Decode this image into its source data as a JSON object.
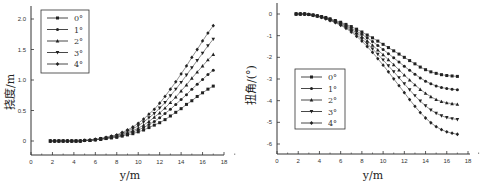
{
  "chart_data": [
    {
      "type": "line",
      "title": "",
      "xlabel": "y/m",
      "ylabel": "挠度/m",
      "xlim": [
        0,
        19
      ],
      "ylim": [
        -0.25,
        2.2
      ],
      "x_ticks": [
        "0",
        "2",
        "4",
        "6",
        "8",
        "10",
        "12",
        "14",
        "16",
        "18"
      ],
      "y_ticks": [
        "0",
        "0.5",
        "1.0",
        "1.5",
        "2.0"
      ],
      "legend_position": "upper left",
      "grid": false,
      "x": [
        1.8,
        2.2,
        2.6,
        3.0,
        3.4,
        3.8,
        4.2,
        4.6,
        5.0,
        5.5,
        6.0,
        6.5,
        7.0,
        7.5,
        8.0,
        8.5,
        9.0,
        9.5,
        10.0,
        10.5,
        11.0,
        11.5,
        12.0,
        12.5,
        13.0,
        13.5,
        14.0,
        14.5,
        15.0,
        15.5,
        16.0,
        16.5,
        17.0
      ],
      "series": [
        {
          "name": "0°",
          "marker": "square",
          "values": [
            0,
            0,
            0,
            0,
            0,
            0,
            0,
            0,
            0.01,
            0.01,
            0.02,
            0.03,
            0.04,
            0.05,
            0.06,
            0.08,
            0.1,
            0.12,
            0.15,
            0.18,
            0.22,
            0.26,
            0.3,
            0.35,
            0.41,
            0.47,
            0.53,
            0.6,
            0.66,
            0.73,
            0.79,
            0.85,
            0.9
          ]
        },
        {
          "name": "1°",
          "marker": "circle",
          "values": [
            0,
            0,
            0,
            0,
            0,
            0,
            0,
            0,
            0.01,
            0.01,
            0.02,
            0.03,
            0.04,
            0.06,
            0.07,
            0.09,
            0.12,
            0.15,
            0.18,
            0.22,
            0.27,
            0.32,
            0.38,
            0.45,
            0.52,
            0.6,
            0.68,
            0.76,
            0.85,
            0.93,
            1.01,
            1.09,
            1.16
          ]
        },
        {
          "name": "2°",
          "marker": "triangle-up",
          "values": [
            0,
            0,
            0,
            0,
            0,
            0,
            0,
            0,
            0.01,
            0.01,
            0.02,
            0.03,
            0.05,
            0.06,
            0.08,
            0.11,
            0.14,
            0.17,
            0.21,
            0.26,
            0.32,
            0.39,
            0.46,
            0.54,
            0.63,
            0.72,
            0.82,
            0.92,
            1.03,
            1.13,
            1.23,
            1.33,
            1.42
          ]
        },
        {
          "name": "3°",
          "marker": "triangle-down",
          "values": [
            0,
            0,
            0,
            0,
            0,
            0,
            0,
            0,
            0.01,
            0.01,
            0.02,
            0.04,
            0.05,
            0.07,
            0.09,
            0.12,
            0.16,
            0.2,
            0.25,
            0.31,
            0.38,
            0.45,
            0.54,
            0.63,
            0.74,
            0.85,
            0.96,
            1.08,
            1.2,
            1.32,
            1.44,
            1.56,
            1.67
          ]
        },
        {
          "name": "4°",
          "marker": "diamond",
          "values": [
            0,
            0,
            0,
            0,
            0,
            0,
            0,
            0,
            0.01,
            0.02,
            0.03,
            0.04,
            0.06,
            0.08,
            0.1,
            0.14,
            0.18,
            0.23,
            0.29,
            0.36,
            0.44,
            0.52,
            0.62,
            0.73,
            0.85,
            0.97,
            1.1,
            1.23,
            1.37,
            1.5,
            1.64,
            1.77,
            1.89
          ]
        }
      ]
    },
    {
      "type": "line",
      "title": "",
      "xlabel": "y/m",
      "ylabel": "扭角/(°)",
      "xlim": [
        0,
        19
      ],
      "ylim": [
        -6.5,
        0.5
      ],
      "x_ticks": [
        "0",
        "2",
        "4",
        "6",
        "8",
        "10",
        "12",
        "14",
        "16",
        "18"
      ],
      "y_ticks": [
        "0",
        "-1",
        "-2",
        "-3",
        "-4",
        "-5",
        "-6"
      ],
      "legend_position": "lower left",
      "grid": false,
      "x": [
        1.8,
        2.2,
        2.6,
        3.0,
        3.4,
        3.8,
        4.2,
        4.6,
        5.0,
        5.5,
        6.0,
        6.5,
        7.0,
        7.5,
        8.0,
        8.5,
        9.0,
        9.5,
        10.0,
        10.5,
        11.0,
        11.5,
        12.0,
        12.5,
        13.0,
        13.5,
        14.0,
        14.5,
        15.0,
        15.5,
        16.0,
        16.5,
        17.0
      ],
      "series": [
        {
          "name": "0°",
          "marker": "square",
          "values": [
            0,
            0,
            0,
            -0.02,
            -0.05,
            -0.08,
            -0.12,
            -0.16,
            -0.22,
            -0.3,
            -0.38,
            -0.48,
            -0.58,
            -0.7,
            -0.83,
            -0.97,
            -1.1,
            -1.25,
            -1.4,
            -1.55,
            -1.7,
            -1.85,
            -2.0,
            -2.15,
            -2.3,
            -2.45,
            -2.57,
            -2.67,
            -2.74,
            -2.8,
            -2.84,
            -2.86,
            -2.88
          ]
        },
        {
          "name": "1°",
          "marker": "circle",
          "values": [
            0,
            0,
            0,
            -0.02,
            -0.05,
            -0.09,
            -0.13,
            -0.18,
            -0.24,
            -0.33,
            -0.42,
            -0.53,
            -0.65,
            -0.79,
            -0.94,
            -1.1,
            -1.27,
            -1.45,
            -1.64,
            -1.83,
            -2.02,
            -2.22,
            -2.41,
            -2.6,
            -2.78,
            -2.95,
            -3.1,
            -3.22,
            -3.32,
            -3.39,
            -3.44,
            -3.47,
            -3.5
          ]
        },
        {
          "name": "2°",
          "marker": "triangle-up",
          "values": [
            0,
            0,
            0,
            -0.02,
            -0.05,
            -0.09,
            -0.14,
            -0.19,
            -0.26,
            -0.35,
            -0.45,
            -0.57,
            -0.71,
            -0.87,
            -1.05,
            -1.24,
            -1.44,
            -1.66,
            -1.88,
            -2.11,
            -2.34,
            -2.58,
            -2.82,
            -3.05,
            -3.27,
            -3.48,
            -3.66,
            -3.82,
            -3.95,
            -4.04,
            -4.1,
            -4.14,
            -4.17
          ]
        },
        {
          "name": "3°",
          "marker": "triangle-down",
          "values": [
            0,
            0,
            0,
            -0.02,
            -0.06,
            -0.1,
            -0.15,
            -0.21,
            -0.28,
            -0.38,
            -0.49,
            -0.62,
            -0.77,
            -0.95,
            -1.15,
            -1.37,
            -1.61,
            -1.86,
            -2.12,
            -2.39,
            -2.66,
            -2.94,
            -3.22,
            -3.5,
            -3.77,
            -4.02,
            -4.24,
            -4.43,
            -4.58,
            -4.7,
            -4.78,
            -4.83,
            -4.87
          ]
        },
        {
          "name": "4°",
          "marker": "diamond",
          "values": [
            0,
            0,
            0,
            -0.02,
            -0.06,
            -0.1,
            -0.16,
            -0.22,
            -0.3,
            -0.4,
            -0.52,
            -0.66,
            -0.83,
            -1.03,
            -1.25,
            -1.5,
            -1.77,
            -2.06,
            -2.36,
            -2.67,
            -2.99,
            -3.31,
            -3.63,
            -3.95,
            -4.26,
            -4.55,
            -4.8,
            -5.02,
            -5.2,
            -5.34,
            -5.44,
            -5.5,
            -5.55
          ]
        }
      ]
    }
  ]
}
